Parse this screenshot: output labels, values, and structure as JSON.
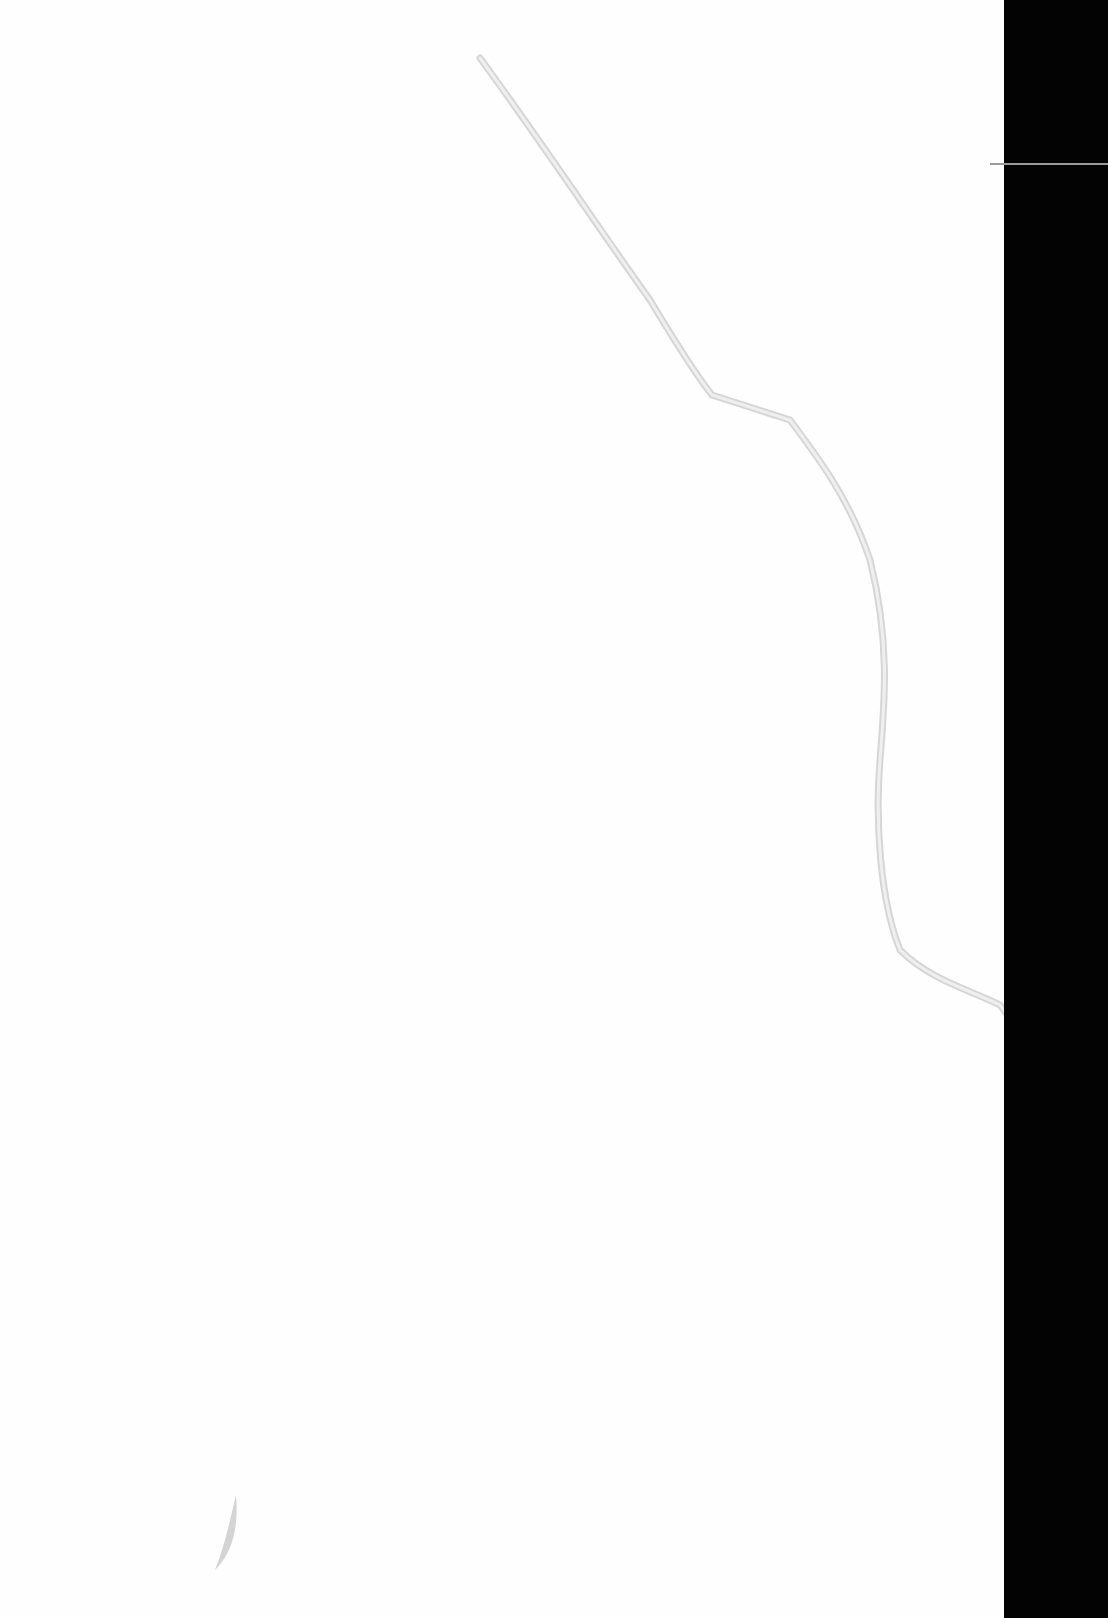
{
  "page": {
    "type": "blank-scanned-page",
    "background_color": "#fefefe",
    "edge_strip_color": "#030303",
    "crease_color": "#d8d8d8"
  }
}
